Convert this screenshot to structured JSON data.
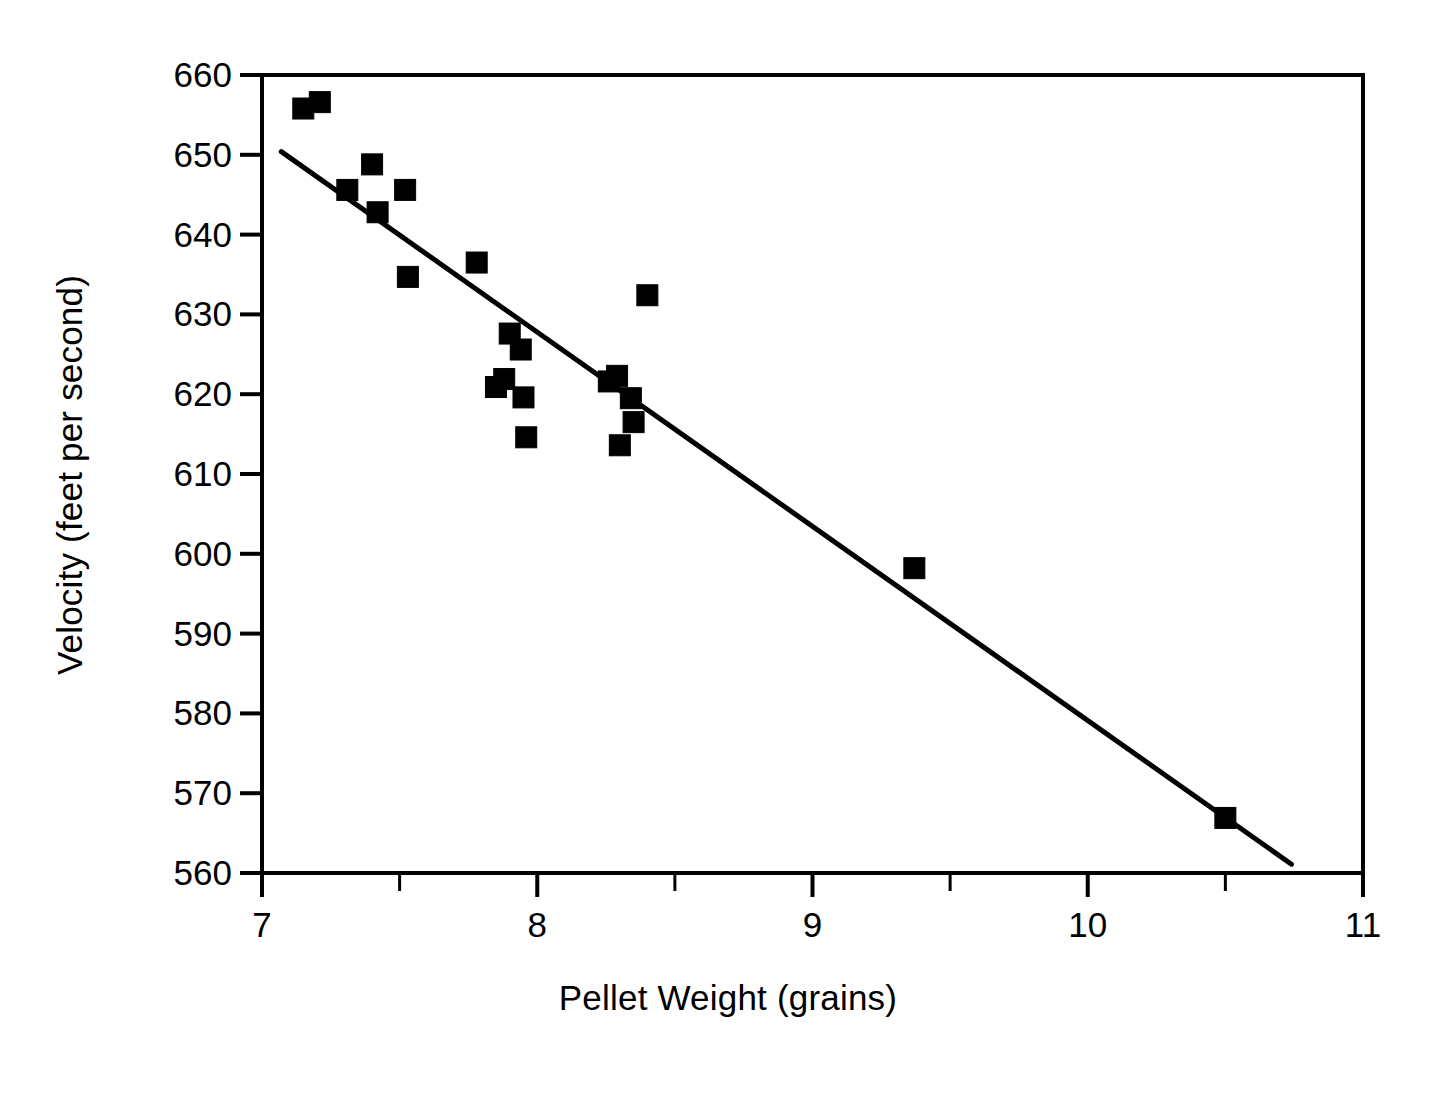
{
  "chart_data": {
    "type": "scatter",
    "title": "",
    "xlabel": "Pellet Weight (grains)",
    "ylabel": "Velocity (feet per second)",
    "xlim": [
      7,
      11
    ],
    "ylim": [
      560,
      660
    ],
    "xticks": [
      7,
      8,
      9,
      10,
      11
    ],
    "xtick_labels": [
      "7",
      "8",
      "9",
      "10",
      "11"
    ],
    "xminor_ticks": [
      7.5,
      8.5,
      9.5,
      10.5
    ],
    "yticks": [
      560,
      570,
      580,
      590,
      600,
      610,
      620,
      630,
      640,
      650,
      660
    ],
    "ytick_labels": [
      "560",
      "570",
      "580",
      "590",
      "600",
      "610",
      "620",
      "630",
      "640",
      "650",
      "660"
    ],
    "grid": false,
    "legend": null,
    "marker": "filled-square",
    "marker_color": "#000000",
    "points": [
      {
        "x": 7.15,
        "y": 655.8
      },
      {
        "x": 7.21,
        "y": 656.6
      },
      {
        "x": 7.31,
        "y": 645.6
      },
      {
        "x": 7.4,
        "y": 648.8
      },
      {
        "x": 7.42,
        "y": 642.8
      },
      {
        "x": 7.52,
        "y": 645.6
      },
      {
        "x": 7.53,
        "y": 634.7
      },
      {
        "x": 7.78,
        "y": 636.5
      },
      {
        "x": 7.85,
        "y": 620.9
      },
      {
        "x": 7.88,
        "y": 621.9
      },
      {
        "x": 7.9,
        "y": 627.6
      },
      {
        "x": 7.94,
        "y": 625.6
      },
      {
        "x": 7.95,
        "y": 619.6
      },
      {
        "x": 7.96,
        "y": 614.6
      },
      {
        "x": 8.26,
        "y": 621.6
      },
      {
        "x": 8.29,
        "y": 622.3
      },
      {
        "x": 8.3,
        "y": 613.6
      },
      {
        "x": 8.34,
        "y": 619.5
      },
      {
        "x": 8.35,
        "y": 616.5
      },
      {
        "x": 8.4,
        "y": 632.4
      },
      {
        "x": 9.37,
        "y": 598.2
      },
      {
        "x": 10.5,
        "y": 566.9
      }
    ],
    "trendline": {
      "label": "least-squares fit",
      "x0": 7.07,
      "y0": 650.4,
      "x1": 10.74,
      "y1": 561.1
    }
  },
  "axes": {
    "frame_color": "#000000"
  }
}
